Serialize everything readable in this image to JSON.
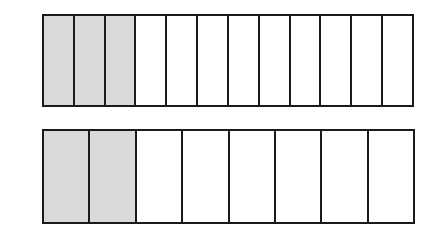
{
  "diagram": {
    "type": "fraction-bars",
    "bars": [
      {
        "name": "top-bar",
        "total_parts": 12,
        "shaded_parts": 3,
        "fraction": "3/12"
      },
      {
        "name": "bottom-bar",
        "total_parts": 8,
        "shaded_parts": 2,
        "fraction": "2/8"
      }
    ],
    "colors": {
      "shaded": "#d9d9d9",
      "unshaded": "#ffffff",
      "border": "#1a1a1a"
    }
  }
}
